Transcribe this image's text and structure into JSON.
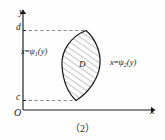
{
  "figure": {
    "caption": "（2）",
    "background_color": "#fefefe",
    "ink_color": "#1a1a1a",
    "axes": {
      "y_axis_label": "y",
      "x_axis_label": "x",
      "origin_label": "O"
    },
    "ticks": [
      {
        "name": "upper-bound-tick",
        "label": "d",
        "axis": "y"
      },
      {
        "name": "lower-bound-tick",
        "label": "c",
        "axis": "y"
      }
    ],
    "region": {
      "label": "D",
      "fill": "hatched",
      "hatch_color": "#555555",
      "outline_color": "#1a1a1a"
    },
    "boundary_curves": [
      {
        "name": "left-boundary",
        "prefix": "x",
        "equals": "=",
        "fn": "ψ",
        "subscript": "1",
        "arg": "(y)",
        "text": "x=ψ1(y)"
      },
      {
        "name": "right-boundary",
        "prefix": "x",
        "equals": "=",
        "fn": "ψ",
        "subscript": "2",
        "arg": "(y)",
        "text": "x=ψ2(y)"
      }
    ],
    "guide_lines": {
      "style": "dashed",
      "color": "#7a7a7a"
    }
  }
}
